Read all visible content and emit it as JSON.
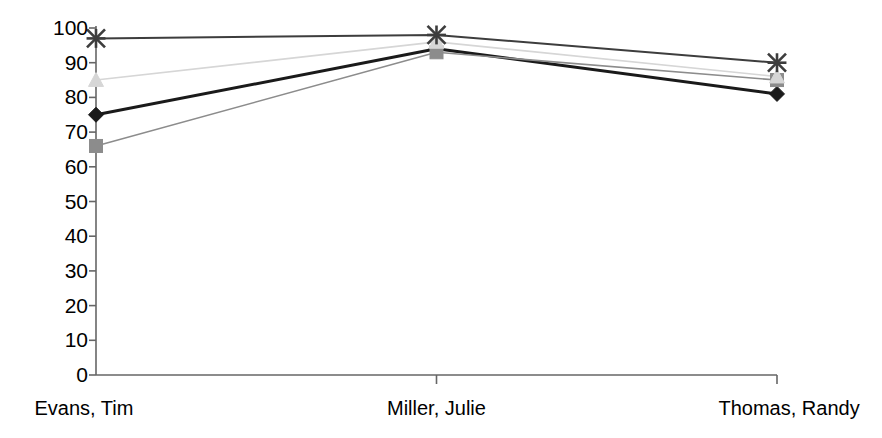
{
  "chart_data": {
    "type": "line",
    "title": "",
    "subtitle": "",
    "xlabel": "",
    "ylabel": "",
    "categories": [
      "Evans, Tim",
      "Miller, Julie",
      "Thomas, Randy"
    ],
    "ylim": [
      0,
      100
    ],
    "ytick_labels": [
      "100",
      "90",
      "80",
      "70",
      "60",
      "50",
      "40",
      "30",
      "20",
      "10",
      "0"
    ],
    "ytick_values": [
      100,
      90,
      80,
      70,
      60,
      50,
      40,
      30,
      20,
      10,
      0
    ],
    "grid": false,
    "legend": "none",
    "series": [
      {
        "name": "Series 1",
        "marker": "diamond",
        "color": "#1a1a1a",
        "line_width": 3,
        "values": [
          75,
          94,
          81
        ]
      },
      {
        "name": "Series 2",
        "marker": "square",
        "color": "#8c8c8c",
        "line_width": 1.6,
        "values": [
          66,
          93,
          85
        ]
      },
      {
        "name": "Series 3",
        "marker": "triangle",
        "color": "#d6d6d6",
        "line_width": 1.6,
        "values": [
          85,
          96,
          86
        ]
      },
      {
        "name": "Series 4",
        "marker": "x",
        "color": "#3d3d3d",
        "line_width": 2,
        "values": [
          97,
          98,
          90
        ]
      }
    ]
  },
  "axis": {
    "line_color": "#666666",
    "tick_color": "#666666"
  }
}
